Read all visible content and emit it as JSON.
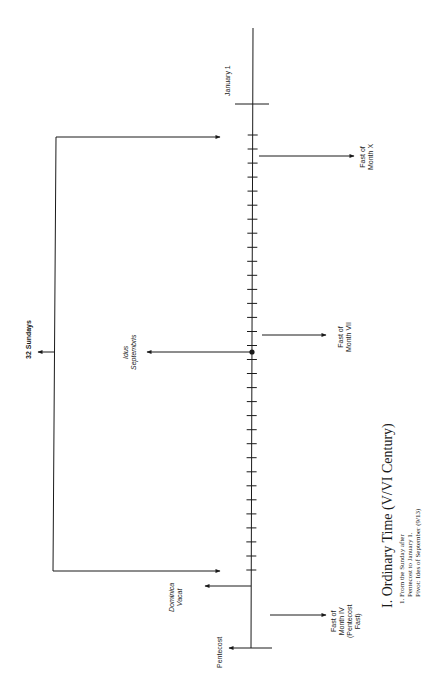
{
  "diagram": {
    "title": "I. Ordinary Time (V/VI Century)",
    "notes": [
      "1. From the Sunday after",
      "Pentecost to January 1.",
      "Pivot: Ides of September (9/13)"
    ],
    "timeline": {
      "start_label": "Pentecost",
      "end_label": "January 1",
      "tick_count": 32,
      "pivot_label_line1": "Idus",
      "pivot_label_line2": "Septembris"
    },
    "bracket": {
      "label": "32 Sundays"
    },
    "markers": {
      "dominica_vacat": {
        "line1": "Dominica",
        "line2": "Vacat"
      },
      "fast_iv": {
        "line1": "Fast of",
        "line2": "Month IV",
        "line3": "(Pentecost",
        "line4": "Fast)"
      },
      "fast_vii": {
        "line1": "Fast of",
        "line2": "Month VII"
      },
      "fast_x": {
        "line1": "Fast of",
        "line2": "Month X"
      }
    },
    "colors": {
      "ink": "#1a1a1a",
      "background": "#ffffff"
    }
  }
}
